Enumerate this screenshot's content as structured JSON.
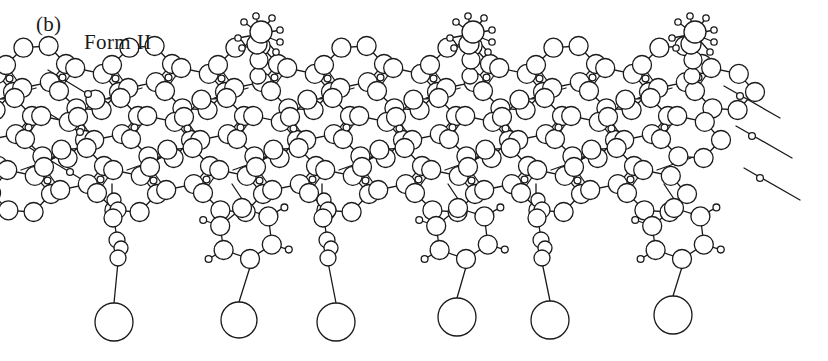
{
  "figure": {
    "panel_letter": "(b)",
    "form_label": "Form II",
    "type": "molecular-structure-diagram",
    "background_color": "#ffffff",
    "stroke_color": "#1a1a1a",
    "stroke_width": 1.3
  },
  "structure_data": {
    "type": "molecular-packing-diagram",
    "description": "Space-filling-outline projection of a polysaccharide (cellulose-like) chain sheet, Form II polymorph, viewed along the chain-stacking direction",
    "atom_sizes": {
      "large_r": 13,
      "ring_r": 9.5,
      "medium_r": 8,
      "small_r": 3.4,
      "tiny_r": 2.6
    },
    "repeat_units": 3,
    "repeat_period_px": 212,
    "layers": [
      {
        "name": "top-layer",
        "baseline_y": 78,
        "x_offset": 50
      },
      {
        "name": "mid-layer",
        "baseline_y": 128,
        "x_offset": 16
      },
      {
        "name": "bottom-layer",
        "baseline_y": 180,
        "x_offset": -18
      }
    ],
    "top_clusters_x": [
      258,
      470,
      692
    ],
    "top_cluster_y": 30,
    "pendant_groups": [
      {
        "index": 0,
        "kind": "chain",
        "x": 112,
        "terminal_circle": {
          "cx": 114,
          "cy": 322,
          "r": 19
        }
      },
      {
        "index": 1,
        "kind": "ring",
        "x": 228,
        "terminal_circle": {
          "cx": 239,
          "cy": 320,
          "r": 18
        }
      },
      {
        "index": 2,
        "kind": "chain",
        "x": 322,
        "terminal_circle": {
          "cx": 336,
          "cy": 322,
          "r": 19
        }
      },
      {
        "index": 3,
        "kind": "ring",
        "x": 444,
        "terminal_circle": {
          "cx": 457,
          "cy": 317,
          "r": 19
        }
      },
      {
        "index": 4,
        "kind": "chain",
        "x": 536,
        "terminal_circle": {
          "cx": 550,
          "cy": 320,
          "r": 19
        }
      },
      {
        "index": 5,
        "kind": "ring",
        "x": 660,
        "terminal_circle": {
          "cx": 673,
          "cy": 315,
          "r": 19
        }
      }
    ],
    "edge_bonds": {
      "left_x": 40,
      "right_x": 800,
      "count_each_side": 3
    }
  }
}
